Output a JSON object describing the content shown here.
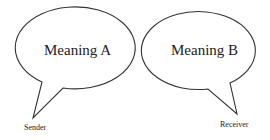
{
  "diagram": {
    "bubbles": [
      {
        "id": "a",
        "text": "Meaning A",
        "speaker": "Sender"
      },
      {
        "id": "b",
        "text": "Meaning B",
        "speaker": "Receiver"
      }
    ],
    "colors": {
      "stroke": "#333333",
      "fill": "#ffffff",
      "text": "#222222"
    }
  }
}
